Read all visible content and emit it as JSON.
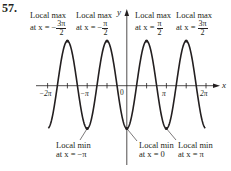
{
  "problem_number": "57.",
  "axes": {
    "x_label": "x",
    "y_label": "y",
    "x_ticks": [
      "−2π",
      "−π",
      "0",
      "π",
      "2π"
    ]
  },
  "annotations": {
    "max1": {
      "title": "Local max",
      "prefix": "at x = −",
      "num": "3π",
      "den": "2"
    },
    "max2": {
      "title": "Local max",
      "prefix": "at x = −",
      "num": "π",
      "den": "2"
    },
    "max3": {
      "title": "Local max",
      "prefix": "at x = ",
      "num": "π",
      "den": "2"
    },
    "max4": {
      "title": "Local max",
      "prefix": "at x = ",
      "num": "3π",
      "den": "2"
    },
    "min1": {
      "title": "Local min",
      "text": "at x = −π"
    },
    "min2": {
      "title": "Local min",
      "text": "at x = 0"
    },
    "min3": {
      "title": "Local min",
      "text": "at x = π"
    }
  },
  "chart_data": {
    "type": "line",
    "function": "y = -cos(2x)",
    "xlim": [
      -6.283,
      6.283
    ],
    "ylim": [
      -1,
      1
    ],
    "x_tick_labels": [
      "-2π",
      "-π",
      "0",
      "π",
      "2π"
    ],
    "xlabel": "x",
    "ylabel": "y",
    "local_max_x": [
      "-3π/2",
      "-π/2",
      "π/2",
      "3π/2"
    ],
    "local_min_x": [
      "-π",
      "0",
      "π"
    ],
    "grid": false
  }
}
